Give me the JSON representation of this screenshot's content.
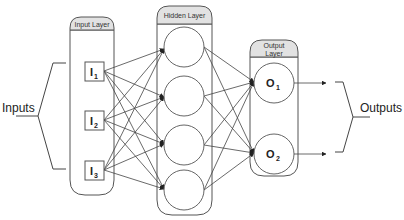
{
  "diagram": {
    "type": "feed-forward neural network",
    "colors": {
      "stroke": "#555555",
      "header_fill": "#e2e2e2",
      "background": "#ffffff",
      "text": "#222222"
    },
    "input_label": "Inputs",
    "output_label": "Outputs",
    "layers": {
      "input": {
        "title": "Input Layer",
        "nodes": [
          {
            "letter": "I",
            "sub": "1"
          },
          {
            "letter": "I",
            "sub": "2"
          },
          {
            "letter": "I",
            "sub": "3"
          }
        ]
      },
      "hidden": {
        "title": "Hidden Layer",
        "node_count": 4
      },
      "output": {
        "title_line1": "Output",
        "title_line2": "Layer",
        "nodes": [
          {
            "letter": "O",
            "sub": "1"
          },
          {
            "letter": "O",
            "sub": "2"
          }
        ]
      }
    },
    "connections": "fully connected: input(3) -> hidden(4) -> output(2)"
  }
}
